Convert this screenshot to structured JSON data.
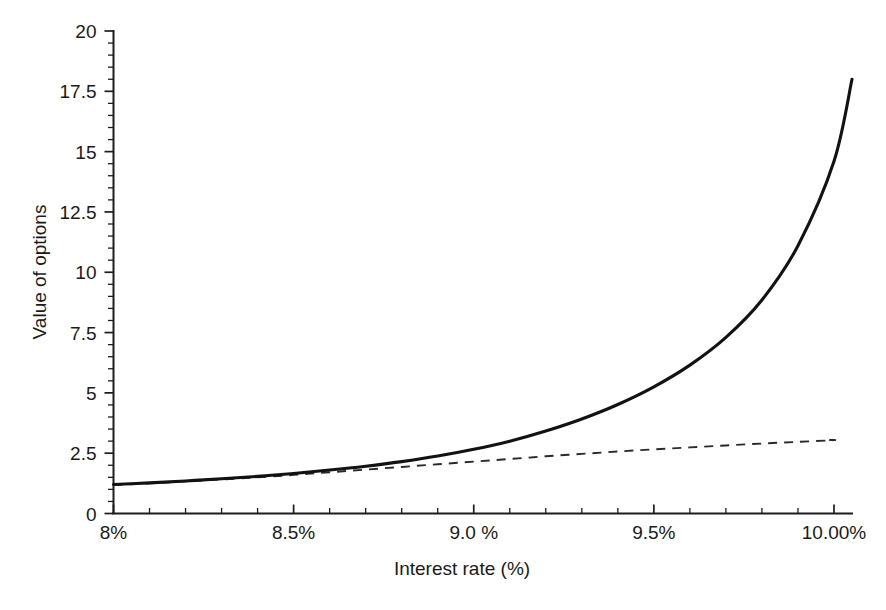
{
  "chart_data": {
    "type": "line",
    "title": "",
    "subtitle": "",
    "xlabel": "Interest rate (%)",
    "ylabel": "Value of options",
    "xlim": [
      8.0,
      10.05
    ],
    "ylim": [
      0,
      20
    ],
    "grid": false,
    "legend": "none",
    "annotations": [],
    "x_ticks": [
      {
        "value": 8.0,
        "label": "8%"
      },
      {
        "value": 8.5,
        "label": "8.5%"
      },
      {
        "value": 9.0,
        "label": "9.0 %"
      },
      {
        "value": 9.5,
        "label": "9.5%"
      },
      {
        "value": 10.0,
        "label": "10.00%"
      }
    ],
    "x_minor_step": 0.1,
    "y_ticks": [
      {
        "value": 0,
        "label": "0"
      },
      {
        "value": 2.5,
        "label": "2.5"
      },
      {
        "value": 5,
        "label": "5"
      },
      {
        "value": 7.5,
        "label": "7.5"
      },
      {
        "value": 10,
        "label": "10"
      },
      {
        "value": 12.5,
        "label": "12.5"
      },
      {
        "value": 15,
        "label": "15"
      },
      {
        "value": 17.5,
        "label": "17.5"
      },
      {
        "value": 20,
        "label": "20"
      }
    ],
    "y_minor_step": 0.5,
    "series": [
      {
        "name": "Value of options (solid)",
        "style": "solid",
        "color": "#121212",
        "x": [
          8.0,
          8.1,
          8.2,
          8.3,
          8.4,
          8.5,
          8.6,
          8.7,
          8.8,
          8.9,
          9.0,
          9.1,
          9.2,
          9.3,
          9.4,
          9.5,
          9.6,
          9.7,
          9.8,
          9.9,
          10.0
        ],
        "values": [
          1.2,
          1.27,
          1.35,
          1.44,
          1.54,
          1.66,
          1.8,
          1.96,
          2.15,
          2.38,
          2.66,
          3.0,
          3.42,
          3.92,
          4.52,
          5.25,
          6.15,
          7.3,
          8.85,
          11.1,
          14.6
        ]
      },
      {
        "name": "Intrinsic / reference value (dashed)",
        "style": "dashed",
        "color": "#2a2a2a",
        "x": [
          8.0,
          8.1,
          8.2,
          8.3,
          8.4,
          8.5,
          8.6,
          8.7,
          8.8,
          8.9,
          9.0,
          9.1,
          9.2,
          9.3,
          9.4,
          9.5,
          9.6,
          9.7,
          9.8,
          9.9,
          10.0
        ],
        "values": [
          1.18,
          1.25,
          1.33,
          1.41,
          1.5,
          1.6,
          1.71,
          1.82,
          1.93,
          2.04,
          2.15,
          2.26,
          2.37,
          2.47,
          2.57,
          2.66,
          2.74,
          2.82,
          2.9,
          2.97,
          3.04
        ]
      }
    ],
    "series_endpoints": {
      "solid_end": {
        "x": 10.05,
        "y": 18.0
      },
      "dashed_end": {
        "x": 9.98,
        "y": 3.05
      }
    }
  },
  "axes": {
    "x_title": "Interest rate (%)",
    "y_title": "Value of options"
  }
}
